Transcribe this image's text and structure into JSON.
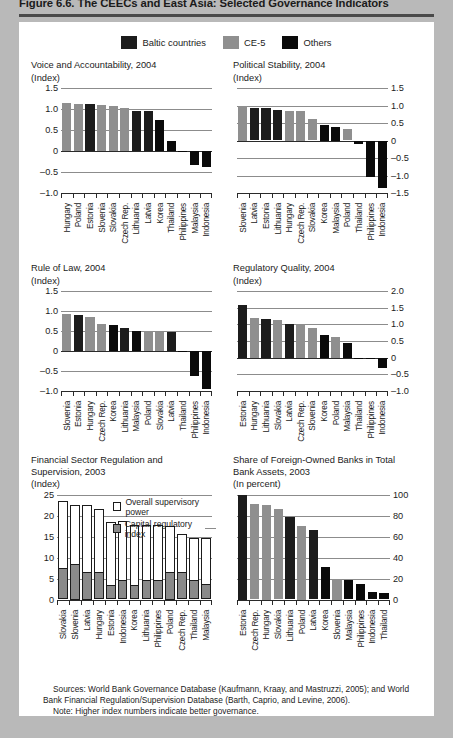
{
  "figure": {
    "title": "Figure 6.6.  The CEECs and East Asia: Selected Governance Indicators",
    "sources": "Sources:  World Bank Governance Database (Kaufmann, Kraay, and Mastruzzi, 2005); and World Bank Financial Regulation/Supervision Database (Barth, Caprio, and Levine, 2006).",
    "note": "Note: Higher index numbers indicate better governance."
  },
  "legend": {
    "items": [
      {
        "label": "Baltic countries",
        "color": "#1c1c1c",
        "key": "baltic"
      },
      {
        "label": "CE-5",
        "color": "#8f8f8f",
        "key": "ce5"
      },
      {
        "label": "Others",
        "color": "#0a0a0a",
        "key": "other"
      }
    ]
  },
  "inline_legend": {
    "overall_label": "Overall supervisory power",
    "capital_label": "Capital regulatory index"
  },
  "chart_data": [
    {
      "id": "voice-and-accountability",
      "type": "bar",
      "title": "Voice and Accountability, 2004",
      "subtitle": "(Index)",
      "xlabel": "",
      "ylabel": "Index",
      "ylim": [
        -1.0,
        1.5
      ],
      "yticks": [
        -1.0,
        -0.5,
        0,
        0.5,
        1.0,
        1.5
      ],
      "ytick_labels": [
        "–1.0",
        "–0.5",
        "0",
        "0.5",
        "1.0",
        "1.5"
      ],
      "axis_side": "left",
      "grid": true,
      "categories": [
        "Hungary",
        "Poland",
        "Estonia",
        "Slovenia",
        "Slovakia",
        "Czech Rep.",
        "Lithuania",
        "Latvia",
        "Korea",
        "Thailand",
        "Philippines",
        "Malaysia",
        "Indonesia"
      ],
      "values": [
        1.15,
        1.12,
        1.12,
        1.1,
        1.08,
        1.02,
        0.96,
        0.96,
        0.73,
        0.24,
        0.0,
        -0.33,
        -0.38
      ],
      "groups": [
        "ce5",
        "ce5",
        "baltic",
        "ce5",
        "ce5",
        "ce5",
        "baltic",
        "baltic",
        "other",
        "other",
        "other",
        "other",
        "other"
      ]
    },
    {
      "id": "political-stability",
      "type": "bar",
      "title": "Political Stability, 2004",
      "subtitle": "(Index)",
      "xlabel": "",
      "ylabel": "Index",
      "ylim": [
        -1.5,
        1.5
      ],
      "yticks": [
        -1.5,
        -1.0,
        -0.5,
        0,
        0.5,
        1.0,
        1.5
      ],
      "ytick_labels": [
        "–1.5",
        "–1.0",
        "–0.5",
        "0",
        "0.5",
        "1.0",
        "1.5"
      ],
      "axis_side": "right",
      "grid": true,
      "categories": [
        "Slovenia",
        "Latvia",
        "Estonia",
        "Lithuania",
        "Hungary",
        "Czech Rep.",
        "Slovakia",
        "Korea",
        "Malaysia",
        "Poland",
        "Thailand",
        "Philippines",
        "Indonesia"
      ],
      "values": [
        1.0,
        0.93,
        0.93,
        0.87,
        0.85,
        0.85,
        0.62,
        0.45,
        0.4,
        0.33,
        -0.1,
        -1.05,
        -1.35
      ],
      "groups": [
        "ce5",
        "baltic",
        "baltic",
        "baltic",
        "ce5",
        "ce5",
        "ce5",
        "other",
        "other",
        "ce5",
        "other",
        "other",
        "other"
      ]
    },
    {
      "id": "rule-of-law",
      "type": "bar",
      "title": "Rule of Law, 2004",
      "subtitle": "(Index)",
      "xlabel": "",
      "ylabel": "Index",
      "ylim": [
        -1.0,
        1.5
      ],
      "yticks": [
        -1.0,
        -0.5,
        0,
        0.5,
        1.0,
        1.5
      ],
      "ytick_labels": [
        "–1.0",
        "–0.5",
        "0",
        "0.5",
        "1.0",
        "1.5"
      ],
      "axis_side": "left",
      "grid": true,
      "categories": [
        "Slovenia",
        "Estonia",
        "Hungary",
        "Czech Rep.",
        "Korea",
        "Lithuania",
        "Malaysia",
        "Poland",
        "Slovakia",
        "Latvia",
        "Thailand",
        "Philippines",
        "Indonesia"
      ],
      "values": [
        0.92,
        0.9,
        0.84,
        0.67,
        0.66,
        0.58,
        0.51,
        0.49,
        0.48,
        0.47,
        -0.03,
        -0.62,
        -0.95
      ],
      "groups": [
        "ce5",
        "baltic",
        "ce5",
        "ce5",
        "other",
        "baltic",
        "other",
        "ce5",
        "ce5",
        "baltic",
        "other",
        "other",
        "other"
      ]
    },
    {
      "id": "regulatory-quality",
      "type": "bar",
      "title": "Regulatory Quality, 2004",
      "subtitle": "(Index)",
      "xlabel": "",
      "ylabel": "Index",
      "ylim": [
        -1.0,
        2.0
      ],
      "yticks": [
        -1.0,
        -0.5,
        0,
        0.5,
        1.0,
        1.5,
        2.0
      ],
      "ytick_labels": [
        "–1.0",
        "–0.5",
        "0",
        "0.5",
        "1.0",
        "1.5",
        "2.0"
      ],
      "axis_side": "right",
      "grid": true,
      "categories": [
        "Estonia",
        "Hungary",
        "Lithuania",
        "Slovakia",
        "Latvia",
        "Czech Rep.",
        "Slovenia",
        "Korea",
        "Poland",
        "Malaysia",
        "Thailand",
        "Philippines",
        "Indonesia"
      ],
      "values": [
        1.58,
        1.2,
        1.15,
        1.13,
        1.02,
        1.0,
        0.9,
        0.67,
        0.62,
        0.45,
        0.0,
        -0.05,
        -0.3
      ],
      "groups": [
        "baltic",
        "ce5",
        "baltic",
        "ce5",
        "baltic",
        "ce5",
        "ce5",
        "other",
        "ce5",
        "other",
        "other",
        "other",
        "other"
      ]
    },
    {
      "id": "financial-sector-regulation",
      "type": "bar",
      "title": "Financial Sector Regulation and\nSupervision,  2003",
      "subtitle": "(Index)",
      "xlabel": "",
      "ylabel": "Index",
      "ylim": [
        0,
        25
      ],
      "yticks": [
        0,
        5,
        10,
        15,
        20,
        25
      ],
      "ytick_labels": [
        "0",
        "5",
        "10",
        "15",
        "20",
        "25"
      ],
      "axis_side": "left",
      "grid": true,
      "stacked": true,
      "categories": [
        "Slovakia",
        "Slovenia",
        "Latvia",
        "Hungary",
        "Estonia",
        "Indonesia",
        "Korea",
        "Lithuania",
        "Philippines",
        "Poland",
        "Czech Rep.",
        "Thailand",
        "Malaysia"
      ],
      "series": [
        {
          "name": "Overall supervisory power",
          "values": [
            23.5,
            22.5,
            22.5,
            21.5,
            18.4,
            18.6,
            17.7,
            17.7,
            17.7,
            17.5,
            15.6,
            14.7,
            14.7
          ]
        },
        {
          "name": "Capital regulatory index",
          "values": [
            7.3,
            8.2,
            6.4,
            6.3,
            3.2,
            4.5,
            3.3,
            4.3,
            4.4,
            6.4,
            6.4,
            4.5,
            3.4
          ]
        }
      ]
    },
    {
      "id": "foreign-owned-banks-share",
      "type": "bar",
      "title": "Share of Foreign-Owned Banks in Total\nBank Assets, 2003",
      "subtitle": "(In percent)",
      "xlabel": "",
      "ylabel": "In percent",
      "ylim": [
        0,
        100
      ],
      "yticks": [
        0,
        20,
        40,
        60,
        80,
        100
      ],
      "ytick_labels": [
        "0",
        "20",
        "40",
        "60",
        "80",
        "100"
      ],
      "axis_side": "right",
      "grid": true,
      "categories": [
        "Estonia",
        "Czech Rep.",
        "Hungary",
        "Slovakia",
        "Lithuania",
        "Poland",
        "Latvia",
        "Korea",
        "Slovenia",
        "Malaysia",
        "Philippines",
        "Indonesia",
        "Thailand"
      ],
      "values": [
        100,
        91,
        90,
        86,
        79,
        70,
        66,
        31,
        20,
        19,
        15,
        7,
        6
      ],
      "groups": [
        "baltic",
        "ce5",
        "ce5",
        "ce5",
        "baltic",
        "ce5",
        "baltic",
        "other",
        "ce5",
        "other",
        "other",
        "other",
        "other"
      ]
    }
  ]
}
